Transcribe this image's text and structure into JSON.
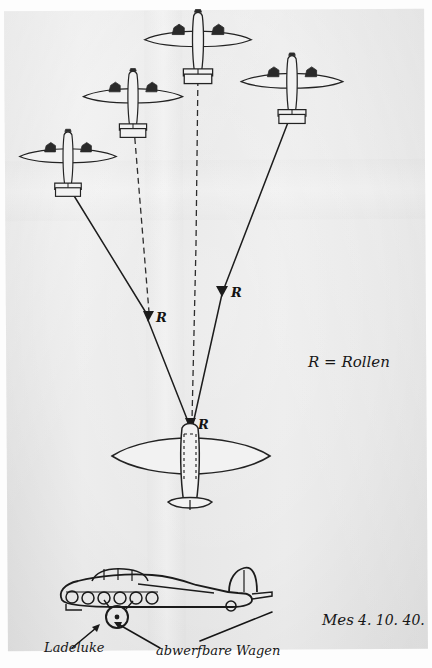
{
  "document": {
    "kind": "handwritten-technical-sketch",
    "medium": "pencil-on-paper-photograph",
    "paper_color": "#e8e8e8",
    "ink_color": "#1b1b1b"
  },
  "annotations": {
    "legend": "R = Rollen",
    "legend_symbol": "R",
    "legend_meaning": "Rollen",
    "label_left": "Ladeluke",
    "label_right": "abwerfbare Wagen",
    "signature": "Mes",
    "date": "4. 10. 40."
  },
  "markers": [
    {
      "name": "roller-marker-left",
      "label": "R",
      "x": 148,
      "y": 318
    },
    {
      "name": "roller-marker-right",
      "label": "R",
      "x": 222,
      "y": 293
    },
    {
      "name": "roller-marker-center",
      "label": "R",
      "x": 196,
      "y": 425
    }
  ],
  "aircraft": [
    {
      "name": "glider-far-left",
      "view": "plan",
      "engines": 2,
      "x": 68,
      "y": 155,
      "scale": 0.78
    },
    {
      "name": "glider-mid-left",
      "view": "plan",
      "engines": 2,
      "x": 133,
      "y": 95,
      "scale": 0.8
    },
    {
      "name": "glider-top",
      "view": "plan",
      "engines": 2,
      "x": 198,
      "y": 38,
      "scale": 0.86
    },
    {
      "name": "glider-right",
      "view": "plan",
      "engines": 2,
      "x": 292,
      "y": 80,
      "scale": 0.82
    },
    {
      "name": "tug-aircraft",
      "view": "plan",
      "engines": 0,
      "x": 190,
      "y": 460,
      "scale": 1.0
    },
    {
      "name": "side-view-aircraft",
      "view": "side",
      "x": 160,
      "y": 595,
      "scale": 1.0
    }
  ],
  "tow_lines": [
    {
      "name": "tow-line-far-left",
      "style": "solid",
      "from": "glider-far-left",
      "to": "roller-marker-left"
    },
    {
      "name": "tow-line-mid-left",
      "style": "dashed",
      "from": "glider-mid-left",
      "to": "roller-marker-left"
    },
    {
      "name": "tow-line-top",
      "style": "dashed",
      "from": "glider-top",
      "to": "tug-aircraft"
    },
    {
      "name": "tow-line-right",
      "style": "solid",
      "from": "glider-right",
      "to": "roller-marker-right"
    },
    {
      "name": "tow-line-converge-left",
      "style": "solid",
      "from": "roller-marker-left",
      "to": "tug-aircraft"
    },
    {
      "name": "tow-line-converge-right",
      "style": "solid",
      "from": "roller-marker-right",
      "to": "tug-aircraft"
    }
  ],
  "leader_lines": [
    {
      "name": "leader-ladeluke",
      "target": "cargo-hatch"
    },
    {
      "name": "leader-abwerfbare-wagen",
      "target": "droppable-trolley"
    }
  ]
}
